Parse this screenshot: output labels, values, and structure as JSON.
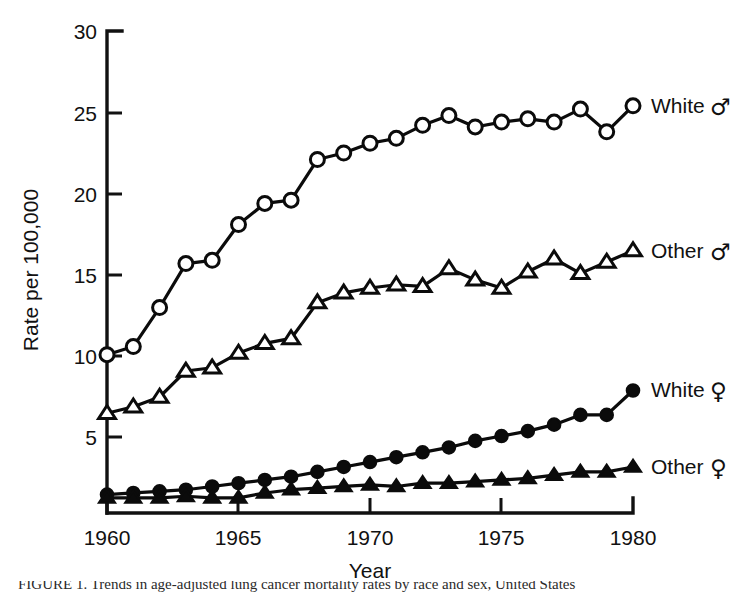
{
  "figure": {
    "caption_partial": "FIGURE 1.  Trends in age-adjusted lung cancer mortality rates by race and sex, United States"
  },
  "chart_data": {
    "type": "line",
    "title": "",
    "xlabel": "Year",
    "ylabel": "Rate per 100,000",
    "xlim": [
      1960,
      1980
    ],
    "ylim": [
      0,
      30
    ],
    "xticks": [
      1960,
      1965,
      1970,
      1975,
      1980
    ],
    "xticklabels": [
      "1960",
      "1965",
      "1970",
      "1975",
      "1980"
    ],
    "yticks": [
      5,
      10,
      15,
      20,
      25,
      30
    ],
    "yticklabels": [
      "5",
      "10",
      "15",
      "20",
      "25",
      "30"
    ],
    "grid": false,
    "legend_position": "right-inline-end-of-line",
    "x": [
      1960,
      1961,
      1962,
      1963,
      1964,
      1965,
      1966,
      1967,
      1968,
      1969,
      1970,
      1971,
      1972,
      1973,
      1974,
      1975,
      1976,
      1977,
      1978,
      1979,
      1980
    ],
    "series": [
      {
        "name": "White ♂",
        "label": "White",
        "sex_symbol": "♂",
        "marker": "open-circle",
        "color": "#0b0b0b",
        "values": [
          10.1,
          10.6,
          13.0,
          15.7,
          15.9,
          18.1,
          19.4,
          19.6,
          22.1,
          22.5,
          23.1,
          23.4,
          24.2,
          24.8,
          24.1,
          24.4,
          24.6,
          24.4,
          25.2,
          23.8,
          25.4
        ]
      },
      {
        "name": "Other ♂",
        "label": "Other",
        "sex_symbol": "♂",
        "marker": "open-triangle",
        "color": "#0b0b0b",
        "values": [
          6.5,
          6.9,
          7.5,
          9.1,
          9.3,
          10.2,
          10.8,
          11.1,
          13.3,
          13.9,
          14.2,
          14.4,
          14.3,
          15.4,
          14.7,
          14.2,
          15.2,
          16.0,
          15.1,
          15.8,
          16.5
        ]
      },
      {
        "name": "White ♀",
        "label": "White",
        "sex_symbol": "♀",
        "marker": "filled-circle",
        "color": "#0b0b0b",
        "values": [
          1.5,
          1.6,
          1.7,
          1.8,
          2.0,
          2.2,
          2.4,
          2.6,
          2.9,
          3.2,
          3.5,
          3.8,
          4.1,
          4.4,
          4.8,
          5.1,
          5.4,
          5.8,
          6.4,
          6.4,
          7.9
        ]
      },
      {
        "name": "Other ♀",
        "label": "Other",
        "sex_symbol": "♀",
        "marker": "filled-triangle",
        "color": "#0b0b0b",
        "values": [
          1.3,
          1.3,
          1.3,
          1.4,
          1.3,
          1.3,
          1.6,
          1.8,
          1.9,
          2.0,
          2.1,
          2.0,
          2.2,
          2.2,
          2.3,
          2.4,
          2.5,
          2.7,
          2.9,
          2.9,
          3.2
        ]
      }
    ],
    "annotations": [
      {
        "text": "White ♂",
        "at_x": 1980,
        "at_y": 25.4
      },
      {
        "text": "Other ♂",
        "at_x": 1980,
        "at_y": 16.5
      },
      {
        "text": "White ♀",
        "at_x": 1980,
        "at_y": 7.9
      },
      {
        "text": "Other ♀",
        "at_x": 1980,
        "at_y": 3.2
      }
    ]
  }
}
